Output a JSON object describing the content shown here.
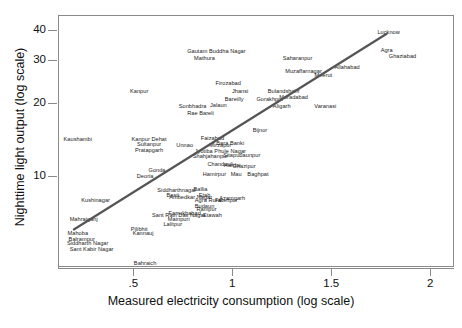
{
  "chart_data": {
    "type": "scatter",
    "title": "",
    "xlabel": "Measured electricity consumption (log scale)",
    "ylabel": "Nighttime light output (log scale)",
    "xtick_labels": [
      ".5",
      "1",
      "1.5",
      "2"
    ],
    "xtick_values": [
      0.5,
      1,
      1.5,
      2
    ],
    "ytick_labels": [
      "10",
      "20",
      "30",
      "40"
    ],
    "ytick_values": [
      10,
      20,
      30,
      40
    ],
    "xlim": [
      0.12,
      2.12
    ],
    "ylim": [
      4.2,
      46
    ],
    "grid": false,
    "legend": false,
    "marker_style": "text-label",
    "fit_line": {
      "label": "linear fit",
      "color": "#555555",
      "x_start": 0.2,
      "y_start": 6.0,
      "x_end": 1.78,
      "y_end": 38.5
    },
    "points": [
      {
        "label": "Lucknow",
        "x": 1.79,
        "y": 39.0
      },
      {
        "label": "Agra",
        "x": 1.78,
        "y": 33.0
      },
      {
        "label": "Ghaziabad",
        "x": 1.86,
        "y": 31.2
      },
      {
        "label": "Gautam Buddha Nagar",
        "x": 0.92,
        "y": 32.6
      },
      {
        "label": "Mathura",
        "x": 0.86,
        "y": 30.5
      },
      {
        "label": "Saharanpur",
        "x": 1.33,
        "y": 30.6
      },
      {
        "label": "Allahabad",
        "x": 1.58,
        "y": 28.1
      },
      {
        "label": "Muzaffarnagar",
        "x": 1.36,
        "y": 27.0
      },
      {
        "label": "Meerut",
        "x": 1.46,
        "y": 26.0
      },
      {
        "label": "Firozabad",
        "x": 0.98,
        "y": 24.2
      },
      {
        "label": "Jhansi",
        "x": 1.04,
        "y": 22.4
      },
      {
        "label": "Bulandshahr",
        "x": 1.26,
        "y": 22.4
      },
      {
        "label": "Bareilly",
        "x": 1.01,
        "y": 20.8
      },
      {
        "label": "Gorakhpur",
        "x": 1.19,
        "y": 20.7
      },
      {
        "label": "Moradabad",
        "x": 1.31,
        "y": 21.2
      },
      {
        "label": "Aligarh",
        "x": 1.25,
        "y": 19.3
      },
      {
        "label": "Varanasi",
        "x": 1.47,
        "y": 19.4
      },
      {
        "label": "Kanpur",
        "x": 0.53,
        "y": 22.4
      },
      {
        "label": "Sonbhadra",
        "x": 0.8,
        "y": 19.4
      },
      {
        "label": "Jalaun",
        "x": 0.93,
        "y": 19.6
      },
      {
        "label": "Rae Bareli",
        "x": 0.84,
        "y": 18.2
      },
      {
        "label": "Bijnor",
        "x": 1.14,
        "y": 15.4
      },
      {
        "label": "Kaushambi",
        "x": 0.22,
        "y": 14.2
      },
      {
        "label": "Kanpur Dehat",
        "x": 0.58,
        "y": 14.2
      },
      {
        "label": "Faizabad",
        "x": 0.9,
        "y": 14.3
      },
      {
        "label": "Sultanpur",
        "x": 0.58,
        "y": 13.5
      },
      {
        "label": "Unnao",
        "x": 0.76,
        "y": 13.4
      },
      {
        "label": "Mirzapur",
        "x": 0.94,
        "y": 13.4
      },
      {
        "label": "Bara Banki",
        "x": 0.99,
        "y": 13.6
      },
      {
        "label": "Pratapgarh",
        "x": 0.58,
        "y": 12.8
      },
      {
        "label": "Jyotiba Phule Nagar",
        "x": 0.94,
        "y": 12.6
      },
      {
        "label": "Shahjahanpur",
        "x": 0.89,
        "y": 12.1
      },
      {
        "label": "Sitapur",
        "x": 1.0,
        "y": 12.2
      },
      {
        "label": "Jaunpur",
        "x": 1.09,
        "y": 12.2
      },
      {
        "label": "Chandauli",
        "x": 0.94,
        "y": 11.2
      },
      {
        "label": "Hardoi",
        "x": 1.0,
        "y": 11.1
      },
      {
        "label": "Ghazipur",
        "x": 1.06,
        "y": 11.0
      },
      {
        "label": "Gonda",
        "x": 0.62,
        "y": 10.6
      },
      {
        "label": "Hamirpur",
        "x": 0.91,
        "y": 10.2
      },
      {
        "label": "Mau",
        "x": 1.02,
        "y": 10.2
      },
      {
        "label": "Baghpat",
        "x": 1.13,
        "y": 10.2
      },
      {
        "label": "Deoria",
        "x": 0.56,
        "y": 10.0
      },
      {
        "label": "Kushinagar",
        "x": 0.31,
        "y": 7.9
      },
      {
        "label": "Siddharthnagar",
        "x": 0.72,
        "y": 8.7
      },
      {
        "label": "Ballia",
        "x": 0.84,
        "y": 8.8
      },
      {
        "label": "Azamgarh",
        "x": 1.0,
        "y": 8.1
      },
      {
        "label": "Basti",
        "x": 0.7,
        "y": 8.3
      },
      {
        "label": "Ambedkar Nagar",
        "x": 0.79,
        "y": 8.2
      },
      {
        "label": "Etah",
        "x": 0.86,
        "y": 8.3
      },
      {
        "label": "Fatehpur",
        "x": 0.97,
        "y": 7.9
      },
      {
        "label": "Agra Rural",
        "x": 0.88,
        "y": 7.9
      },
      {
        "label": "Budaun",
        "x": 0.86,
        "y": 7.5
      },
      {
        "label": "Rampur",
        "x": 0.87,
        "y": 7.3
      },
      {
        "label": "Farrukhabad",
        "x": 0.76,
        "y": 7.0
      },
      {
        "label": "Etawah",
        "x": 0.9,
        "y": 6.9
      },
      {
        "label": "Mahrajganj",
        "x": 0.25,
        "y": 6.6
      },
      {
        "label": "Sant Ravi Das Nagar",
        "x": 0.73,
        "y": 6.9
      },
      {
        "label": "Mainpuri",
        "x": 0.73,
        "y": 6.6
      },
      {
        "label": "Lalitpur",
        "x": 0.7,
        "y": 6.3
      },
      {
        "label": "Pilibhit",
        "x": 0.53,
        "y": 6.0
      },
      {
        "label": "Kannauj",
        "x": 0.55,
        "y": 5.8
      },
      {
        "label": "Mahoba",
        "x": 0.22,
        "y": 5.8
      },
      {
        "label": "Balrampur",
        "x": 0.24,
        "y": 5.5
      },
      {
        "label": "Siddharth Nagar",
        "x": 0.27,
        "y": 5.3
      },
      {
        "label": "Sant Kabir Nagar",
        "x": 0.29,
        "y": 5.0
      },
      {
        "label": "Bahraich",
        "x": 0.56,
        "y": 4.35
      }
    ]
  },
  "axes": {
    "x_title": "Measured electricity consumption (log scale)",
    "y_title": "Nighttime light output (log scale)"
  }
}
